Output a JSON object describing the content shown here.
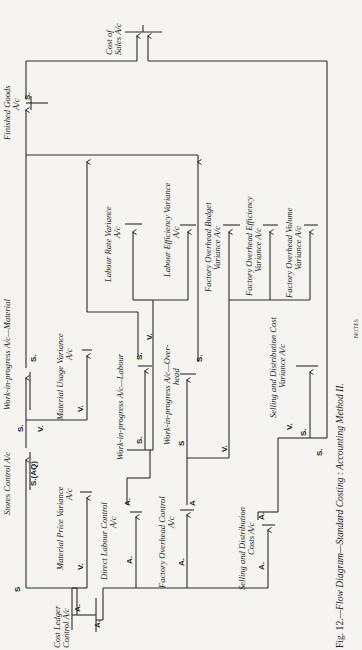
{
  "figure": {
    "caption_number": "Fig. 12.",
    "caption_text": "—Flow Diagram—Standard Costing : Accounting Method II.",
    "notes_label": "NOTES"
  },
  "accounts": {
    "cost_ledger_control": [
      "Cost Ledger",
      "Control A/c"
    ],
    "stores_control": "Stores Control A/c",
    "material_price_variance": [
      "Material Price Variance",
      "A/c"
    ],
    "wip_material": "Work-in-progress A/c—Material",
    "material_usage_variance": [
      "Material Usage Variance",
      "A/c"
    ],
    "direct_labour_control": [
      "Direct Labour Control",
      "A/c"
    ],
    "wip_labour": "Work-in-progress A/c—Labour",
    "labour_rate_variance": [
      "Labour Rate Variance",
      "A/c"
    ],
    "labour_efficiency_variance": [
      "Labour Efficiency Variance",
      "A/c"
    ],
    "factory_overhead_control": [
      "Factory Overhead Control",
      "A/c"
    ],
    "wip_overhead": [
      "Work-in-progress A/c—Over-",
      "head"
    ],
    "fo_budget_variance": [
      "Factory Overhead Budget",
      "Variance A/c"
    ],
    "fo_efficiency_variance": [
      "Factory Overhead Efficiency",
      "Variance A/c"
    ],
    "fo_volume_variance": [
      "Factory Overhead Volume",
      "Variance A/c"
    ],
    "sd_costs": [
      "Selling and Distribution",
      "Costs A/c"
    ],
    "sd_cost_variance": [
      "Selling and Distribution Cost",
      "Variance A/c"
    ],
    "finished_goods": [
      "Finished Goods",
      "A/c"
    ],
    "cost_of_sales": [
      "Cost of",
      "Sales A/c"
    ]
  },
  "markers": {
    "actual": "A.",
    "actual_plain": "A",
    "standard": "S.",
    "standard_plain": "S",
    "variance": "V.",
    "standard_aq": "S.(AQ)"
  },
  "legend": {
    "A": "Actual",
    "S": "Standard",
    "V": "Variance"
  }
}
